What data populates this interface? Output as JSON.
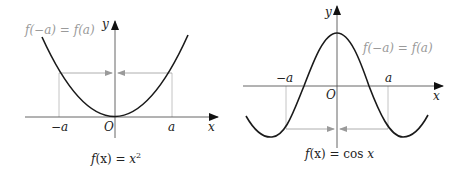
{
  "diagrams": [
    {
      "id": "even-parabola",
      "caption_fx": "f",
      "caption_arg": "(x) = ",
      "caption_rhs": "x",
      "caption_exp": "2",
      "annotation": "f(−a) = f(a)",
      "axis_x_label": "x",
      "axis_y_label": "y",
      "origin_label": "O",
      "tick_neg": "−a",
      "tick_pos": "a"
    },
    {
      "id": "even-cosine",
      "caption_fx": "f",
      "caption_arg": "(x) = ",
      "caption_rhs_fn": "cos ",
      "caption_rhs": "x",
      "annotation": "f(−a) = f(a)",
      "axis_x_label": "x",
      "axis_y_label": "y",
      "origin_label": "O",
      "tick_neg": "−a",
      "tick_pos": "a"
    }
  ],
  "colors": {
    "curve": "#1a1a1a",
    "axis": "#555555",
    "guide": "#b5b5b5",
    "annotation": "#9a9a9a"
  }
}
